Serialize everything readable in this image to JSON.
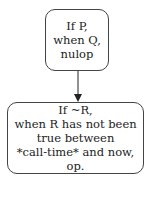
{
  "diagram": {
    "nodes": [
      {
        "id": "n1",
        "lines": [
          "If P,",
          "when Q,",
          "nulop"
        ]
      },
      {
        "id": "n2",
        "lines": [
          "If ~R,",
          "when R has not been",
          "true between",
          "*call-time* and now,",
          "op."
        ]
      }
    ],
    "edges": [
      {
        "from": "n1",
        "to": "n2"
      }
    ]
  }
}
